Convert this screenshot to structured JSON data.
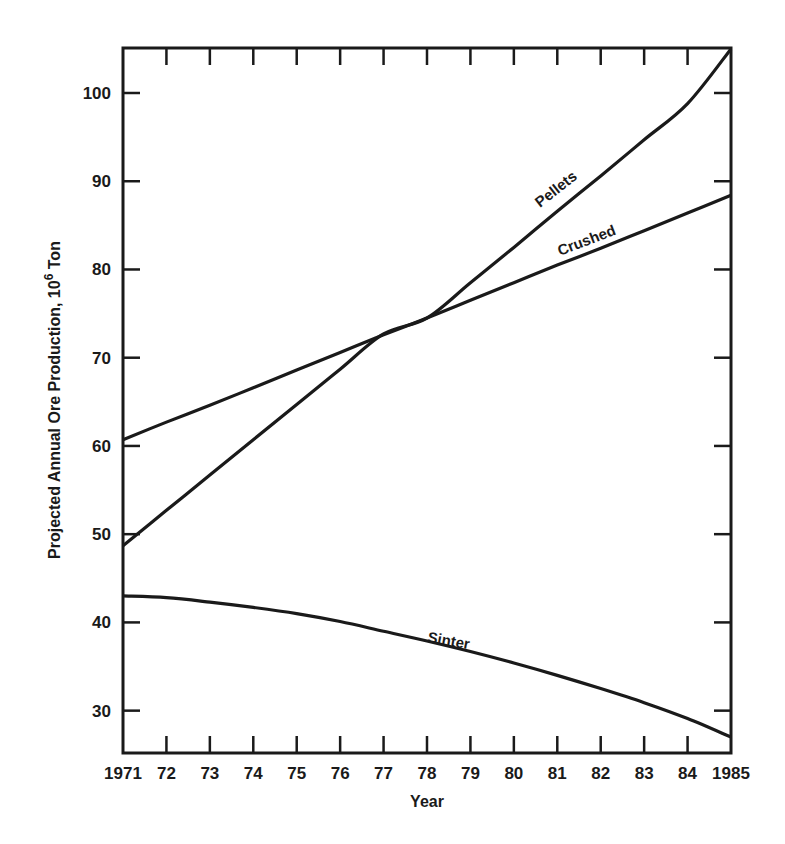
{
  "chart_data": {
    "type": "line",
    "title": "",
    "xlabel": "Year",
    "ylabel": "Projected Annual Ore Production, 10^6 Ton",
    "ylabel_parts": {
      "main": "Projected Annual Ore Production, 10",
      "sup": "6",
      "unit": " Ton"
    },
    "x": [
      1971,
      1972,
      1973,
      1974,
      1975,
      1976,
      1977,
      1978,
      1979,
      1980,
      1981,
      1982,
      1983,
      1984,
      1985
    ],
    "x_tick_labels": [
      "1971",
      "72",
      "73",
      "74",
      "75",
      "76",
      "77",
      "78",
      "79",
      "80",
      "81",
      "82",
      "83",
      "84",
      "1985"
    ],
    "y_ticks": [
      30,
      40,
      50,
      60,
      70,
      80,
      90,
      100
    ],
    "y_tick_labels": [
      "30",
      "40",
      "50",
      "60",
      "70",
      "80",
      "90",
      "100"
    ],
    "xlim": [
      1971,
      1985
    ],
    "ylim": [
      25.2,
      105.1
    ],
    "grid": false,
    "legend": "inline labels",
    "series": [
      {
        "name": "Pellets",
        "values": [
          48.7,
          52.7,
          56.7,
          60.7,
          64.7,
          68.7,
          72.7,
          74.5,
          78.5,
          82.5,
          86.6,
          90.6,
          94.7,
          98.8,
          105.0
        ]
      },
      {
        "name": "Crushed",
        "values": [
          60.7,
          62.7,
          64.6,
          66.6,
          68.6,
          70.6,
          72.6,
          74.5,
          76.5,
          78.5,
          80.5,
          82.4,
          84.4,
          86.4,
          88.4
        ]
      },
      {
        "name": "Sinter",
        "values": [
          43.0,
          42.8,
          42.3,
          41.7,
          41.0,
          40.1,
          39.0,
          37.9,
          36.7,
          35.4,
          34.0,
          32.5,
          30.9,
          29.1,
          27.0
        ]
      }
    ],
    "annotations": [
      {
        "text": "Pellets",
        "series": "Pellets",
        "near_x": 1981.8
      },
      {
        "text": "Crushed",
        "series": "Crushed",
        "near_x": 1982.3
      },
      {
        "text": "Sinter",
        "series": "Sinter",
        "near_x": 1979.2
      }
    ]
  },
  "labels": {
    "pellets": "Pellets",
    "crushed": "Crushed",
    "sinter": "Sinter",
    "xlabel": "Year",
    "ylabel_main": "Projected Annual Ore Production, 10",
    "ylabel_sup": "6",
    "ylabel_unit": " Ton"
  },
  "style": {
    "line_color": "#1a1a1a",
    "background": "#ffffff"
  }
}
